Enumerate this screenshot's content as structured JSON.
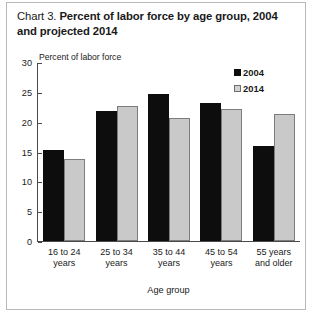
{
  "title": {
    "label": "Chart 3.",
    "main": "Percent of labor force by age group, 2004 and projected 2014"
  },
  "chart_data": {
    "type": "bar",
    "title": "Chart 3. Percent of labor force by age group, 2004 and projected 2014",
    "subtitle": "",
    "xlabel": "Age group",
    "ylabel": "Percent of labor force",
    "categories": [
      "16 to 24 years",
      "25 to 34 years",
      "35 to 44 years",
      "45 to 54 years",
      "55 years and older"
    ],
    "category_lines": [
      [
        "16 to 24",
        "years"
      ],
      [
        "25 to 34",
        "years"
      ],
      [
        "35 to 44",
        "years"
      ],
      [
        "45 to 54",
        "years"
      ],
      [
        "55 years",
        "and older"
      ]
    ],
    "series": [
      {
        "name": "2004",
        "color": "#0d0d0d",
        "values": [
          15.2,
          21.8,
          24.6,
          23.2,
          15.9
        ]
      },
      {
        "name": "2014",
        "color": "#c9c9c9",
        "values": [
          13.7,
          22.7,
          20.6,
          22.2,
          21.3
        ]
      }
    ],
    "ylim": [
      0,
      30
    ],
    "yticks": [
      0,
      5,
      10,
      15,
      20,
      25,
      30
    ],
    "ytick_labels": [
      "0",
      "5",
      "10",
      "15",
      "20",
      "25",
      "30"
    ],
    "grid": false,
    "legend_position": "top-right"
  }
}
